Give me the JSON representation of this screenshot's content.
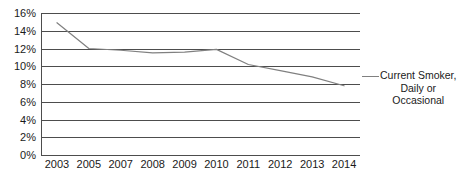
{
  "chart_data": {
    "type": "line",
    "title": "",
    "xlabel": "",
    "ylabel": "",
    "grid": true,
    "legend_position": "right",
    "categories": [
      "2003",
      "2005",
      "2007",
      "2008",
      "2009",
      "2010",
      "2011",
      "2012",
      "2013",
      "2014"
    ],
    "ylim": [
      0,
      16
    ],
    "ytick_labels": [
      "16%",
      "14%",
      "12%",
      "10%",
      "8%",
      "6%",
      "4%",
      "2%",
      "0%"
    ],
    "ytick_values": [
      16,
      14,
      12,
      10,
      8,
      6,
      4,
      2,
      0
    ],
    "series": [
      {
        "name": "Current Smoker, Daily or Occasional",
        "color": "#808080",
        "values": [
          14.9,
          12.0,
          11.8,
          11.5,
          11.6,
          11.9,
          10.2,
          9.5,
          8.8,
          7.8
        ]
      }
    ],
    "legend": [
      {
        "line1": "Current Smoker,",
        "line2": "Daily or",
        "line3": "Occasional"
      }
    ]
  },
  "colors": {
    "series_line": "#808080",
    "grid": "#4d4d4d",
    "text": "#1a1a1a",
    "background": "#ffffff"
  }
}
